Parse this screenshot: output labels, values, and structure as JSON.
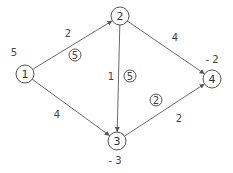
{
  "diagram": {
    "type": "network-flow",
    "nodes": [
      {
        "id": "1",
        "label": "1",
        "x": 25,
        "y": 74,
        "supply": "5",
        "supply_x": 14,
        "supply_y": 52
      },
      {
        "id": "2",
        "label": "2",
        "x": 120,
        "y": 16,
        "supply": "",
        "supply_x": 0,
        "supply_y": 0
      },
      {
        "id": "3",
        "label": "3",
        "x": 117,
        "y": 141,
        "supply": "- 3",
        "supply_x": 115,
        "supply_y": 160
      },
      {
        "id": "4",
        "label": "4",
        "x": 212,
        "y": 79,
        "supply": "- 2",
        "supply_x": 212,
        "supply_y": 59
      }
    ],
    "edges": [
      {
        "from": "1",
        "to": "2",
        "cost": "2",
        "cost_x": 68,
        "cost_y": 33,
        "flow": "5",
        "flow_x": 75,
        "flow_y": 55
      },
      {
        "from": "1",
        "to": "3",
        "cost": "4",
        "cost_x": 57,
        "cost_y": 114,
        "flow": "",
        "flow_x": 0,
        "flow_y": 0
      },
      {
        "from": "2",
        "to": "3",
        "cost": "1",
        "cost_x": 111,
        "cost_y": 76,
        "flow": "5",
        "flow_x": 130,
        "flow_y": 76
      },
      {
        "from": "2",
        "to": "4",
        "cost": "4",
        "cost_x": 175,
        "cost_y": 37,
        "flow": "",
        "flow_x": 0,
        "flow_y": 0
      },
      {
        "from": "3",
        "to": "4",
        "cost": "2",
        "cost_x": 179,
        "cost_y": 118,
        "flow": "2",
        "flow_x": 156,
        "flow_y": 100
      }
    ],
    "colors": {
      "line": "#6a6a6a",
      "text": "#444444",
      "background": "#ffffff"
    }
  }
}
